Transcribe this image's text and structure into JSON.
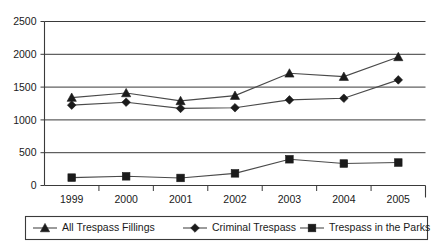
{
  "chart_data": {
    "type": "line",
    "title": "",
    "subtitle": "",
    "xlabel": "",
    "ylabel": "",
    "categories": [
      "1999",
      "2000",
      "2001",
      "2002",
      "2003",
      "2004",
      "2005"
    ],
    "ylim": [
      0,
      2500
    ],
    "y_ticks": [
      0,
      500,
      1000,
      1500,
      2000,
      2500
    ],
    "y_tick_labels": [
      "0",
      "500",
      "1000",
      "1500",
      "2000",
      "2500"
    ],
    "grid": true,
    "grid_axis": "y",
    "legend_position": "bottom",
    "series": [
      {
        "name": "All Trespass Fillings",
        "marker": "triangle",
        "color": "#1b1b1b",
        "values": [
          1340,
          1410,
          1290,
          1370,
          1710,
          1660,
          1960
        ]
      },
      {
        "name": "Criminal Trespass",
        "marker": "diamond",
        "color": "#1b1b1b",
        "values": [
          1225,
          1270,
          1175,
          1185,
          1305,
          1330,
          1610
        ]
      },
      {
        "name": "Trespass in the Parks",
        "marker": "square",
        "color": "#1b1b1b",
        "values": [
          120,
          140,
          115,
          185,
          400,
          335,
          350
        ]
      }
    ]
  },
  "legend": {
    "items": [
      {
        "label": "All Trespass Fillings",
        "marker": "triangle"
      },
      {
        "label": "Criminal Trespass",
        "marker": "diamond"
      },
      {
        "label": "Trespass in the Parks",
        "marker": "square"
      }
    ]
  },
  "axes": {
    "y_labels": [
      "2500",
      "2000",
      "1500",
      "1000",
      "500",
      "0"
    ],
    "x_labels": [
      "1999",
      "2000",
      "2001",
      "2002",
      "2003",
      "2004",
      "2005"
    ]
  },
  "colors": {
    "line": "#4a4a4a",
    "marker": "#1b1b1b",
    "grid": "#3a3a3a",
    "frame": "#3a3a3a",
    "text": "#1a1a1a",
    "background": "#ffffff"
  }
}
